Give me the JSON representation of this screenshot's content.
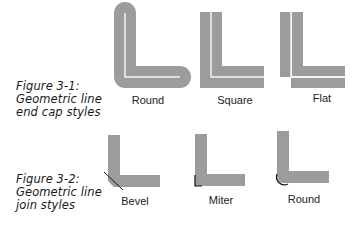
{
  "figures": [
    {
      "id": "3-1",
      "caption": [
        "Figure 3-1:",
        "Geometric line",
        "end cap styles"
      ],
      "items": [
        {
          "label": "Round"
        },
        {
          "label": "Square"
        },
        {
          "label": "Flat"
        }
      ]
    },
    {
      "id": "3-2",
      "caption": [
        "Figure 3-2:",
        "Geometric line",
        "join styles"
      ],
      "items": [
        {
          "label": "Bevel"
        },
        {
          "label": "Miter"
        },
        {
          "label": "Round"
        }
      ]
    }
  ],
  "colors": {
    "stroke_fill": "#9c9c9c",
    "centerline": "#f2f2f2",
    "join_outline": "#111111",
    "text": "#222222"
  }
}
